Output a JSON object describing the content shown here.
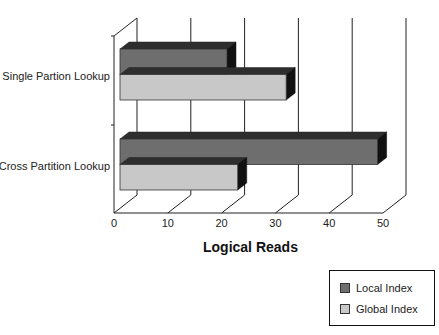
{
  "chart_data": {
    "type": "bar",
    "orientation": "horizontal",
    "style": "3d",
    "title": "",
    "xlabel": "Logical Reads",
    "ylabel": "",
    "categories": [
      "Single Partion Lookup",
      "Cross Partition Lookup"
    ],
    "series": [
      {
        "name": "Local Index",
        "values": [
          21,
          49
        ],
        "color": "#6e6e6e"
      },
      {
        "name": "Global Index",
        "values": [
          32,
          23
        ],
        "color": "#c8c8c8"
      }
    ],
    "xlim": [
      0,
      50
    ],
    "xticks": [
      "0",
      "10",
      "20",
      "30",
      "40",
      "50"
    ],
    "grid": true,
    "legend_position": "bottom-right"
  },
  "legend": {
    "items": [
      {
        "label": "Local Index",
        "color": "#6e6e6e"
      },
      {
        "label": "Global Index",
        "color": "#c8c8c8"
      }
    ]
  }
}
